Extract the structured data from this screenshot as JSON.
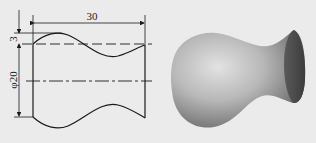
{
  "drawing": {
    "dimensions": {
      "length": "30",
      "amplitude": "3",
      "diameter": "φ20"
    },
    "colors": {
      "background": "#ebebeb",
      "line": "#1a1a1a",
      "shade_light": "#d8d8d8",
      "shade_dark": "#4a4a4a"
    }
  },
  "render": {
    "description": "3D shaded solid of revolution"
  }
}
